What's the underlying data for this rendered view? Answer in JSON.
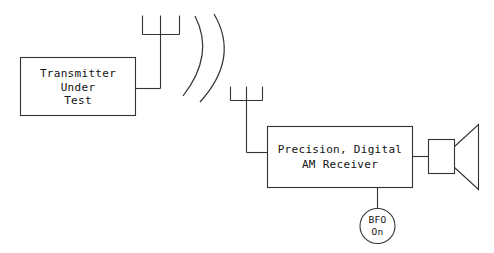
{
  "diagram": {
    "background_color": "#ffffff",
    "line_color": "#333333",
    "text_color": "#111111",
    "blocks": {
      "transmitter": {
        "name": "transmitter-under-test-block",
        "line1": "Transmitter",
        "line2": "Under",
        "line3": "Test"
      },
      "receiver": {
        "name": "precision-digital-am-receiver-block",
        "line1": "Precision, Digital",
        "line2": "AM Receiver"
      },
      "bfo": {
        "name": "bfo-on-indicator",
        "line1": "BFO",
        "line2": "On"
      },
      "speaker": {
        "name": "speaker",
        "label": ""
      }
    },
    "antennas": {
      "transmit_antenna": "transmit-antenna",
      "receive_antenna": "receive-antenna"
    },
    "radio_waves": {
      "name": "radio-wave-arcs",
      "count": 2
    }
  }
}
